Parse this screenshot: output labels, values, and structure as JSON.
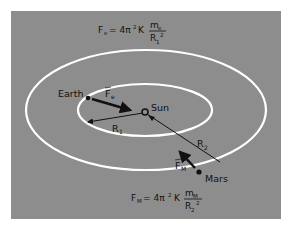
{
  "diagram": {
    "background_color": "#8d8d8d",
    "orbit_color": "#ffffff",
    "formula_top": {
      "lhs": "F",
      "lhs_sub": "e",
      "coef": "= 4π",
      "coef_sup": "2",
      "const": "K",
      "numerator": "m",
      "numerator_sub": "e",
      "denominator": "R",
      "denominator_sub": "1",
      "denominator_sup": "2"
    },
    "formula_bottom": {
      "lhs": "F",
      "lhs_sub": "M",
      "coef": "= 4π",
      "coef_sup": "2",
      "const": "K",
      "numerator": "m",
      "numerator_sub": "M",
      "denominator": "R",
      "denominator_sub": "2",
      "denominator_sup": "2"
    },
    "bodies": {
      "sun": "Sun",
      "earth": "Earth",
      "mars": "Mars"
    },
    "vectors": {
      "earth_force": "F",
      "earth_force_sub": "e",
      "mars_force": "F",
      "mars_force_sub": "M",
      "r1": "R",
      "r1_sub": "1",
      "r2": "R",
      "r2_sub": "2"
    }
  }
}
